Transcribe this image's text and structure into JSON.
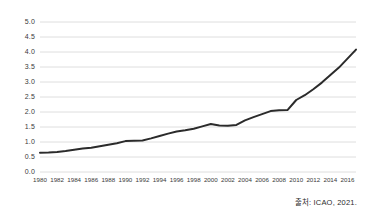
{
  "source_note": "출처: ICAO, 2021.",
  "colors": {
    "line": "#2b2b2b",
    "gridline": "#d5d5d5",
    "tick_text": "#3a3a3a",
    "background": "#ffffff"
  },
  "chart_data": {
    "type": "line",
    "title": "",
    "subtitle": "",
    "xlabel": "",
    "ylabel": "",
    "grid": true,
    "legend": "none",
    "xlim": [
      1980,
      2017
    ],
    "ylim": [
      0.0,
      5.0
    ],
    "ytick_labels": [
      "0.0",
      "0.5",
      "1.0",
      "1.5",
      "2.0",
      "2.5",
      "3.0",
      "3.5",
      "4.0",
      "4.5",
      "5.0"
    ],
    "ytick_values": [
      0.0,
      0.5,
      1.0,
      1.5,
      2.0,
      2.5,
      3.0,
      3.5,
      4.0,
      4.5,
      5.0
    ],
    "xtick_labels": [
      "1980",
      "1982",
      "1984",
      "1986",
      "1988",
      "1990",
      "1992",
      "1994",
      "1996",
      "1998",
      "2000",
      "2002",
      "2004",
      "2006",
      "2008",
      "2010",
      "2012",
      "2014",
      "2016"
    ],
    "xtick_values": [
      1980,
      1982,
      1984,
      1986,
      1988,
      1990,
      1992,
      1994,
      1996,
      1998,
      2000,
      2002,
      2004,
      2006,
      2008,
      2010,
      2012,
      2014,
      2016
    ],
    "x": [
      1980,
      1981,
      1982,
      1983,
      1984,
      1985,
      1986,
      1987,
      1988,
      1989,
      1990,
      1991,
      1992,
      1993,
      1994,
      1995,
      1996,
      1997,
      1998,
      1999,
      2000,
      2001,
      2002,
      2003,
      2004,
      2005,
      2006,
      2007,
      2008,
      2009,
      2010,
      2011,
      2012,
      2013,
      2014,
      2015,
      2016,
      2017
    ],
    "series": [
      {
        "name": "Passengers",
        "values": [
          0.64,
          0.65,
          0.67,
          0.7,
          0.74,
          0.78,
          0.81,
          0.86,
          0.91,
          0.96,
          1.03,
          1.04,
          1.05,
          1.12,
          1.2,
          1.28,
          1.35,
          1.39,
          1.44,
          1.52,
          1.6,
          1.55,
          1.54,
          1.57,
          1.72,
          1.83,
          1.93,
          2.03,
          2.06,
          2.07,
          2.4,
          2.56,
          2.76,
          2.98,
          3.23,
          3.48,
          3.78,
          4.08
        ],
        "line_width": 2.0
      }
    ]
  }
}
